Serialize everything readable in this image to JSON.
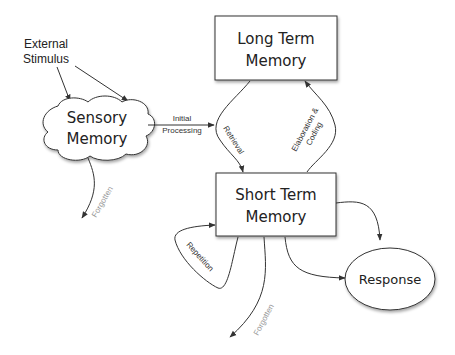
{
  "nodes": {
    "external_stimulus": {
      "line1": "External",
      "line2": "Stimulus"
    },
    "sensory_memory": {
      "line1": "Sensory",
      "line2": "Memory",
      "shape": "cloud"
    },
    "long_term_memory": {
      "line1": "Long Term",
      "line2": "Memory",
      "shape": "rectangle"
    },
    "short_term_memory": {
      "line1": "Short Term",
      "line2": "Memory",
      "shape": "rectangle"
    },
    "response": {
      "label": "Response",
      "shape": "ellipse"
    }
  },
  "edges": {
    "initial_processing": {
      "line1": "Initial",
      "line2": "Processing"
    },
    "retrieval": {
      "label": "Retrieval"
    },
    "elaboration": {
      "line1": "Elaboration &",
      "line2": "Coding"
    },
    "repetition": {
      "label": "Repetition"
    },
    "forgotten_sensory": {
      "label": "Forgotten"
    },
    "forgotten_short": {
      "label": "Forgotten"
    }
  },
  "colors": {
    "stroke": "#333333",
    "text": "#222222",
    "muted_text": "#999999",
    "fill": "#ffffff"
  }
}
